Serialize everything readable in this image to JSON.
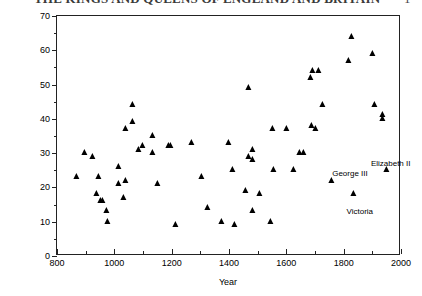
{
  "page_bleed": {
    "top_title_fragment": "THE KINGS AND QUEENS OF ENGLAND AND BRITAIN",
    "corner_fragment": "1"
  },
  "chart_data": {
    "type": "scatter",
    "title": "",
    "xlabel": "Year",
    "ylabel": "Age At Ascension to the Throne",
    "xlim": [
      800,
      2000
    ],
    "ylim": [
      0,
      70
    ],
    "xticks": [
      800,
      1000,
      1200,
      1400,
      1600,
      1800,
      2000
    ],
    "xtick_labels": [
      "800",
      "1000",
      "1200",
      "1400",
      "1600",
      "1800",
      "2000"
    ],
    "xminor_step": 100,
    "yticks": [
      0,
      10,
      20,
      30,
      40,
      50,
      60,
      70
    ],
    "ytick_labels": [
      "0",
      "10",
      "20",
      "30",
      "40",
      "50",
      "60",
      "70"
    ],
    "yminor_step": 5,
    "grid": false,
    "legend": null,
    "marker": "triangle-up",
    "marker_color": "#000000",
    "points": [
      {
        "x": 871,
        "y": 23
      },
      {
        "x": 899,
        "y": 30
      },
      {
        "x": 924,
        "y": 29
      },
      {
        "x": 939,
        "y": 18
      },
      {
        "x": 946,
        "y": 23
      },
      {
        "x": 955,
        "y": 16
      },
      {
        "x": 959,
        "y": 16
      },
      {
        "x": 975,
        "y": 13
      },
      {
        "x": 978,
        "y": 10
      },
      {
        "x": 1016,
        "y": 21
      },
      {
        "x": 1016,
        "y": 26
      },
      {
        "x": 1035,
        "y": 17
      },
      {
        "x": 1040,
        "y": 22
      },
      {
        "x": 1042,
        "y": 37
      },
      {
        "x": 1066,
        "y": 44
      },
      {
        "x": 1066,
        "y": 39
      },
      {
        "x": 1087,
        "y": 31
      },
      {
        "x": 1100,
        "y": 32
      },
      {
        "x": 1135,
        "y": 35
      },
      {
        "x": 1135,
        "y": 30
      },
      {
        "x": 1154,
        "y": 21
      },
      {
        "x": 1189,
        "y": 32
      },
      {
        "x": 1199,
        "y": 32
      },
      {
        "x": 1216,
        "y": 9
      },
      {
        "x": 1272,
        "y": 33
      },
      {
        "x": 1307,
        "y": 23
      },
      {
        "x": 1327,
        "y": 14
      },
      {
        "x": 1377,
        "y": 10
      },
      {
        "x": 1399,
        "y": 33
      },
      {
        "x": 1413,
        "y": 25
      },
      {
        "x": 1422,
        "y": 9
      },
      {
        "x": 1461,
        "y": 19
      },
      {
        "x": 1470,
        "y": 49
      },
      {
        "x": 1471,
        "y": 29
      },
      {
        "x": 1483,
        "y": 13
      },
      {
        "x": 1483,
        "y": 31
      },
      {
        "x": 1485,
        "y": 28
      },
      {
        "x": 1509,
        "y": 18
      },
      {
        "x": 1547,
        "y": 10
      },
      {
        "x": 1553,
        "y": 37
      },
      {
        "x": 1558,
        "y": 25
      },
      {
        "x": 1603,
        "y": 37
      },
      {
        "x": 1625,
        "y": 25
      },
      {
        "x": 1649,
        "y": 30
      },
      {
        "x": 1660,
        "y": 30
      },
      {
        "x": 1685,
        "y": 52
      },
      {
        "x": 1689,
        "y": 38
      },
      {
        "x": 1694,
        "y": 54
      },
      {
        "x": 1702,
        "y": 37
      },
      {
        "x": 1714,
        "y": 54
      },
      {
        "x": 1727,
        "y": 44
      },
      {
        "x": 1760,
        "y": 22
      },
      {
        "x": 1820,
        "y": 57
      },
      {
        "x": 1830,
        "y": 64
      },
      {
        "x": 1837,
        "y": 18
      },
      {
        "x": 1901,
        "y": 59
      },
      {
        "x": 1910,
        "y": 44
      },
      {
        "x": 1936,
        "y": 40
      },
      {
        "x": 1936,
        "y": 41
      },
      {
        "x": 1952,
        "y": 25
      }
    ],
    "annotations": [
      {
        "label": "George III",
        "x": 1760,
        "y": 25
      },
      {
        "label": "Elizabeth II",
        "x": 1895,
        "y": 28
      },
      {
        "label": "Victoria",
        "x": 1810,
        "y": 14
      }
    ]
  }
}
